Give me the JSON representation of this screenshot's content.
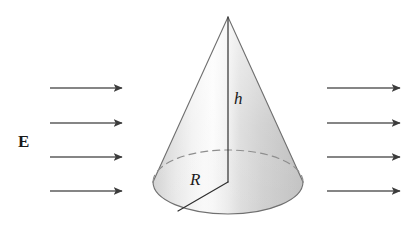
{
  "figure": {
    "background_color": "#ffffff",
    "width": 415,
    "height": 230
  },
  "labels": {
    "field_label": "E",
    "height_label": "h",
    "radius_label": "R"
  },
  "colors": {
    "arrow_color": "#5a5a5a",
    "arrow_head_color": "#3c3c3c",
    "outline_color": "#4a4a4a",
    "dashed_color": "#8a8a8a",
    "measure_line_color": "#333333",
    "cone_light": "#ffffff",
    "cone_mid": "#e8e8e8",
    "cone_dark": "#b8b8b8",
    "text_color": "#1a1a1a"
  },
  "cone": {
    "apex": {
      "x": 228,
      "y": 17
    },
    "base_center": {
      "x": 228,
      "y": 182
    },
    "base_rx": 75,
    "base_ry": 32,
    "height_px": 165,
    "radius_endpoint": {
      "x": 178,
      "y": 210
    }
  },
  "arrows": {
    "left_group": {
      "x_start": 50,
      "x_end": 122,
      "rows": [
        88,
        123,
        157,
        191
      ]
    },
    "right_group": {
      "x_start": 327,
      "x_end": 400,
      "rows": [
        88,
        123,
        157,
        191
      ]
    },
    "count_left": 4,
    "count_right": 4,
    "direction": "rightward"
  },
  "label_positions": {
    "E": {
      "x": 18,
      "y": 133
    },
    "h": {
      "x": 234,
      "y": 90
    },
    "R": {
      "x": 190,
      "y": 171
    }
  }
}
